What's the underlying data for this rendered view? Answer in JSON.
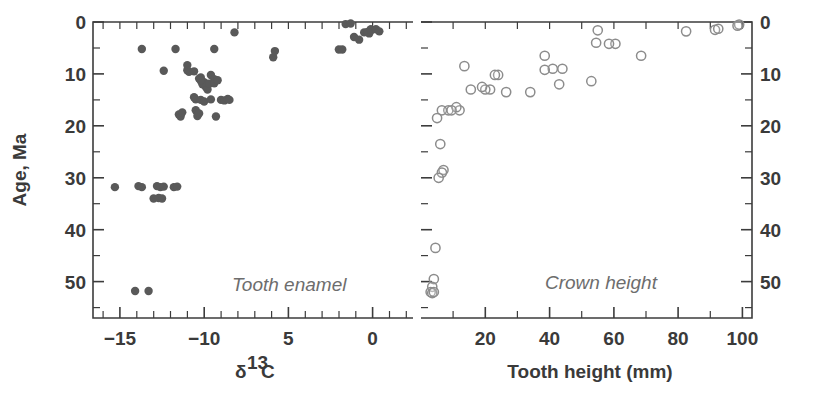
{
  "figure": {
    "width": 813,
    "height": 400,
    "background": "#ffffff",
    "ink_color": "#3a3a3a",
    "filled_marker_color": "#595959",
    "open_marker_color": "#8c8c8c",
    "panel_label_color": "#6d6d6d"
  },
  "shared_axis": {
    "label": "Age, Ma",
    "ticks_major": [
      "0",
      "10",
      "20",
      "30",
      "40",
      "50"
    ],
    "tick_values": [
      0,
      10,
      20,
      30,
      40,
      50
    ],
    "minor_step": 5,
    "range": [
      0,
      57
    ],
    "direction": "inverted"
  },
  "left_panel": {
    "name": "Tooth enamel",
    "xlabel_delta": "δ",
    "xlabel_sup": "13",
    "xlabel_element": "C",
    "x_ticklabels": [
      "−15",
      "−10",
      "5",
      "0"
    ],
    "x_tickvalues": [
      -15,
      -10,
      -5,
      0
    ],
    "x_range": [
      -16.6,
      2.4
    ],
    "minor_step": 1
  },
  "right_panel": {
    "name": "Crown height",
    "xlabel": "Tooth height (mm)",
    "x_ticklabels": [
      "20",
      "40",
      "60",
      "80",
      "100"
    ],
    "x_tickvalues": [
      20,
      40,
      60,
      80,
      100
    ],
    "x_range": [
      0,
      103
    ],
    "minor_step": 10
  },
  "chart_data": [
    {
      "type": "scatter",
      "title": "Tooth enamel",
      "xlabel": "δ13C",
      "ylabel": "Age, Ma",
      "xlim": [
        -16.6,
        2.4
      ],
      "ylim": [
        0,
        57
      ],
      "y_inverted": true,
      "grid": false,
      "legend": "none",
      "marker": "filled-circle",
      "marker_color": "#595959",
      "x": [
        -8.2,
        -13.7,
        -11.7,
        -9.4,
        -5.9,
        -5.8,
        -1.6,
        -1.3,
        -0.1,
        -0.2,
        -12.4,
        -11.0,
        -11.0,
        -10.9,
        -10.6,
        -10.2,
        -10.0,
        -9.6,
        -9.4,
        -10.1,
        -10.3,
        -10.2,
        -9.9,
        -9.8,
        -9.7,
        -9.4,
        -9.2,
        -10.6,
        -10.5,
        -10.2,
        -10.0,
        -9.6,
        -9.0,
        -8.8,
        -8.6,
        -8.5,
        -11.5,
        -11.4,
        -11.3,
        -10.5,
        -10.4,
        -10.3,
        -9.3,
        -15.3,
        -13.9,
        -13.7,
        -12.8,
        -12.6,
        -12.4,
        -11.8,
        -11.6,
        -13.0,
        -12.7,
        -12.5,
        -1.1,
        -0.8,
        -0.5,
        -0.3,
        -0.1,
        0.2,
        0.4,
        -2.0,
        -1.8,
        -14.1,
        -13.3
      ],
      "y": [
        2.0,
        5.2,
        5.2,
        5.2,
        6.8,
        5.6,
        0.4,
        0.3,
        1.4,
        2.2,
        9.4,
        8.3,
        9.3,
        9.6,
        9.5,
        10.7,
        11.6,
        10.2,
        11.0,
        12.0,
        10.9,
        11.3,
        12.5,
        13.0,
        11.9,
        11.8,
        11.2,
        14.5,
        14.9,
        15.0,
        15.3,
        14.9,
        15.0,
        15.1,
        14.8,
        15.0,
        17.8,
        18.2,
        17.4,
        17.0,
        18.1,
        17.6,
        18.2,
        31.8,
        31.6,
        31.8,
        31.6,
        31.8,
        31.7,
        31.8,
        31.7,
        34.0,
        33.9,
        34.0,
        2.9,
        3.4,
        2.0,
        1.9,
        1.6,
        1.4,
        1.8,
        5.3,
        5.3,
        51.8,
        51.8
      ],
      "n_points": 65
    },
    {
      "type": "scatter",
      "title": "Crown height",
      "xlabel": "Tooth height (mm)",
      "ylabel": "Age, Ma",
      "xlim": [
        0,
        103
      ],
      "ylim": [
        0,
        57
      ],
      "y_inverted": true,
      "grid": false,
      "legend": "none",
      "marker": "open-circle",
      "marker_color": "#8c8c8c",
      "x": [
        99.0,
        98.5,
        91.5,
        92.5,
        82.5,
        68.5,
        60.5,
        58.5,
        55.0,
        54.5,
        53.0,
        44.0,
        43.0,
        41.0,
        38.5,
        38.5,
        34.0,
        26.5,
        24.0,
        23.0,
        21.5,
        20.0,
        19.0,
        15.5,
        13.5,
        12.0,
        11.0,
        8.5,
        6.5,
        5.0,
        9.5,
        6.0,
        7.0,
        6.5,
        5.5,
        4.5,
        4.0,
        3.5,
        3.0,
        3.5,
        4.0
      ],
      "y": [
        0.5,
        0.7,
        1.5,
        1.3,
        1.8,
        6.5,
        4.2,
        4.2,
        1.6,
        4.0,
        11.4,
        9.0,
        12.0,
        9.0,
        6.5,
        9.2,
        13.5,
        13.5,
        10.2,
        10.2,
        13.0,
        13.0,
        12.5,
        13.0,
        8.5,
        17.0,
        16.4,
        17.0,
        17.0,
        18.5,
        17.0,
        23.5,
        28.5,
        29.0,
        30.0,
        43.5,
        49.5,
        51.0,
        52.0,
        52.2,
        52.0
      ],
      "n_points": 41
    }
  ]
}
